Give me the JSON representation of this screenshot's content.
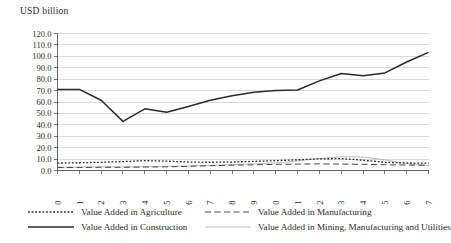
{
  "axis_title": "USD billion",
  "legend": {
    "items": [
      {
        "label": "Value Added in Agriculture",
        "key": "dotted",
        "color": "#2b2b2b"
      },
      {
        "label": "Value Added in Manufacturing",
        "key": "dashed",
        "color": "#4a4a4a"
      },
      {
        "label": "Value Added in Construction",
        "key": "solid-thick",
        "color": "#2b2b2b"
      },
      {
        "label": "Value Added in Mining, Manufacturing and Utilities",
        "key": "solid-thin",
        "color": "#b0b0b0"
      }
    ]
  },
  "chart_data": {
    "type": "line",
    "title": "",
    "xlabel": "",
    "ylabel": "USD billion",
    "ylim": [
      0.0,
      120.0
    ],
    "ytick_step": 10.0,
    "grid": true,
    "legend_position": "bottom",
    "ytick_labels": [
      "120.0",
      "110.0",
      "100.0",
      "90.0",
      "80.0",
      "70.0",
      "60.0",
      "50.0",
      "40.0",
      "30.0",
      "20.0",
      "10.0",
      "0.0"
    ],
    "categories": [
      "2000",
      "2001",
      "2002",
      "2003",
      "2004",
      "2005",
      "2006",
      "2007",
      "2008",
      "2009",
      "2010",
      "2011",
      "2012",
      "2013",
      "2014",
      "2015",
      "2016",
      "2017"
    ],
    "series": [
      {
        "name": "Value Added in Agriculture",
        "style": "dotted",
        "color": "#2b2b2b",
        "values": [
          6.5,
          6.8,
          7.2,
          7.8,
          8.6,
          8.2,
          7.4,
          7.2,
          7.4,
          8.0,
          8.6,
          9.4,
          10.2,
          10.4,
          9.0,
          7.2,
          6.6,
          6.4
        ]
      },
      {
        "name": "Value Added in Construction",
        "style": "solid-thick",
        "color": "#2b2b2b",
        "values": [
          71.0,
          71.0,
          61.5,
          43.0,
          54.0,
          51.0,
          56.0,
          61.5,
          65.5,
          68.5,
          70.0,
          70.5,
          78.5,
          85.0,
          83.0,
          85.5,
          95.0,
          103.5
        ]
      },
      {
        "name": "Value Added in Manufacturing",
        "style": "dashed",
        "color": "#4a4a4a",
        "values": [
          2.6,
          2.6,
          2.8,
          2.8,
          3.0,
          3.2,
          3.6,
          4.2,
          4.6,
          5.0,
          5.4,
          5.6,
          5.8,
          5.6,
          5.4,
          5.0,
          4.8,
          4.6
        ]
      },
      {
        "name": "Value Added in Mining, Manufacturing and Utilities",
        "style": "solid-thin",
        "color": "#b0b0b0",
        "values": [
          3.0,
          3.0,
          3.2,
          3.2,
          3.4,
          3.6,
          4.0,
          4.6,
          5.2,
          5.8,
          6.6,
          8.4,
          10.6,
          12.0,
          11.8,
          9.4,
          6.0,
          4.4
        ]
      }
    ]
  }
}
